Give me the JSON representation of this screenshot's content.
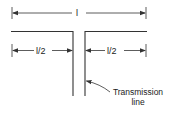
{
  "diagram": {
    "type": "dipole-antenna",
    "labels": {
      "total_length": "l",
      "left_half": "l/2",
      "right_half": "l/2",
      "feed_caption_line1": "Transmission",
      "feed_caption_line2": "line"
    },
    "colors": {
      "line": "#333333",
      "background": "#ffffff"
    }
  }
}
